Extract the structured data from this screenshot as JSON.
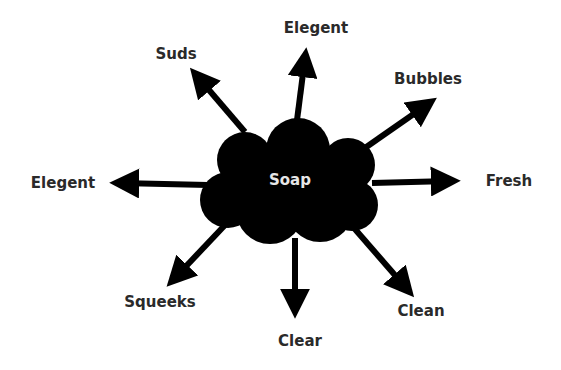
{
  "diagram": {
    "type": "mind-map",
    "center": {
      "label": "Soap",
      "x": 290,
      "y": 180
    },
    "colors": {
      "shape": "#000000",
      "text": "#2a2a2a",
      "center_text": "#e6e6e6",
      "background": "#ffffff"
    },
    "branches": [
      {
        "label": "Suds",
        "lx": 176,
        "ly": 54
      },
      {
        "label": "Elegent",
        "lx": 316,
        "ly": 28
      },
      {
        "label": "Bubbles",
        "lx": 428,
        "ly": 79
      },
      {
        "label": "Elegent",
        "lx": 63,
        "ly": 183
      },
      {
        "label": "Fresh",
        "lx": 509,
        "ly": 181
      },
      {
        "label": "Squeeks",
        "lx": 160,
        "ly": 302
      },
      {
        "label": "Clear",
        "lx": 300,
        "ly": 341
      },
      {
        "label": "Clean",
        "lx": 421,
        "ly": 311
      }
    ]
  }
}
